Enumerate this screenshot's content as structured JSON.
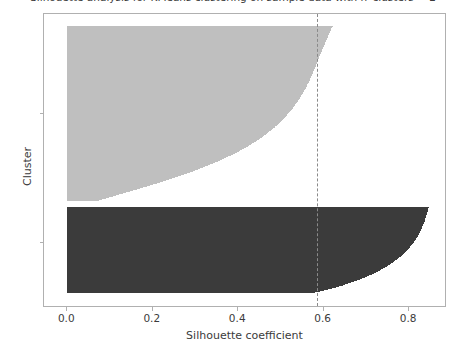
{
  "chart_data": {
    "type": "bar",
    "orientation": "horizontal",
    "title": "Silhouette analysis for KMeans clustering on sample data with n_clusters = 2",
    "xlabel": "Silhouette coefficient",
    "ylabel": "Cluster",
    "xlim": [
      -0.0545,
      0.8885
    ],
    "ylim": [
      0,
      1
    ],
    "grid": false,
    "legend": false,
    "xticks": [
      0.0,
      0.2,
      0.4,
      0.6,
      0.8
    ],
    "xticklabels": [
      "0.0",
      "0.2",
      "0.4",
      "0.6",
      "0.8"
    ],
    "yticks": [
      1,
      2
    ],
    "yticklabels": [
      "1",
      "2"
    ],
    "ytick_positions_px": [
      242,
      113
    ],
    "average_silhouette_score": 0.585,
    "average_line_label": "average silhouette score",
    "average_line_color": "#8a8a8a",
    "average_line_style": "dashed",
    "clusters": [
      {
        "label": "1",
        "name": "cluster-1",
        "color": "#3b3b3b",
        "n_samples": 86,
        "y_top_px": 206,
        "y_bottom_px": 292,
        "silhouette_min": 0.58,
        "silhouette_max": 0.846,
        "silhouette_values_ascending": [
          0.58,
          0.592,
          0.601,
          0.611,
          0.62,
          0.628,
          0.636,
          0.644,
          0.651,
          0.658,
          0.665,
          0.672,
          0.678,
          0.684,
          0.69,
          0.696,
          0.701,
          0.707,
          0.712,
          0.717,
          0.722,
          0.726,
          0.731,
          0.735,
          0.739,
          0.743,
          0.747,
          0.751,
          0.755,
          0.758,
          0.762,
          0.765,
          0.768,
          0.771,
          0.774,
          0.777,
          0.78,
          0.783,
          0.785,
          0.788,
          0.79,
          0.793,
          0.795,
          0.797,
          0.799,
          0.801,
          0.803,
          0.805,
          0.807,
          0.809,
          0.811,
          0.812,
          0.814,
          0.815,
          0.817,
          0.818,
          0.82,
          0.821,
          0.822,
          0.824,
          0.825,
          0.826,
          0.827,
          0.828,
          0.829,
          0.83,
          0.831,
          0.832,
          0.833,
          0.834,
          0.835,
          0.836,
          0.836,
          0.837,
          0.838,
          0.839,
          0.839,
          0.84,
          0.841,
          0.841,
          0.842,
          0.843,
          0.843,
          0.844,
          0.845,
          0.846
        ]
      },
      {
        "label": "2",
        "name": "cluster-2",
        "color": "#bfbfbf",
        "n_samples": 175,
        "y_top_px": 25,
        "y_bottom_px": 200,
        "silhouette_min": 0.075,
        "silhouette_max": 0.622,
        "silhouette_values_ascending": [
          0.075,
          0.082,
          0.09,
          0.098,
          0.106,
          0.114,
          0.122,
          0.13,
          0.138,
          0.146,
          0.154,
          0.162,
          0.17,
          0.178,
          0.186,
          0.194,
          0.201,
          0.209,
          0.216,
          0.224,
          0.231,
          0.238,
          0.245,
          0.252,
          0.259,
          0.266,
          0.273,
          0.28,
          0.286,
          0.293,
          0.299,
          0.305,
          0.311,
          0.317,
          0.323,
          0.329,
          0.335,
          0.341,
          0.346,
          0.352,
          0.357,
          0.362,
          0.367,
          0.372,
          0.377,
          0.382,
          0.387,
          0.392,
          0.396,
          0.401,
          0.405,
          0.409,
          0.414,
          0.418,
          0.422,
          0.426,
          0.43,
          0.433,
          0.437,
          0.441,
          0.444,
          0.448,
          0.451,
          0.455,
          0.458,
          0.461,
          0.464,
          0.467,
          0.47,
          0.473,
          0.476,
          0.479,
          0.482,
          0.485,
          0.487,
          0.49,
          0.492,
          0.495,
          0.497,
          0.5,
          0.502,
          0.504,
          0.507,
          0.509,
          0.511,
          0.513,
          0.515,
          0.517,
          0.519,
          0.521,
          0.523,
          0.525,
          0.527,
          0.529,
          0.531,
          0.532,
          0.534,
          0.536,
          0.537,
          0.539,
          0.541,
          0.542,
          0.544,
          0.545,
          0.547,
          0.548,
          0.55,
          0.551,
          0.552,
          0.554,
          0.555,
          0.556,
          0.558,
          0.559,
          0.56,
          0.561,
          0.562,
          0.564,
          0.565,
          0.566,
          0.567,
          0.568,
          0.569,
          0.57,
          0.571,
          0.572,
          0.573,
          0.574,
          0.575,
          0.576,
          0.577,
          0.578,
          0.579,
          0.58,
          0.581,
          0.582,
          0.583,
          0.584,
          0.585,
          0.585,
          0.586,
          0.587,
          0.588,
          0.589,
          0.59,
          0.591,
          0.592,
          0.593,
          0.594,
          0.595,
          0.596,
          0.597,
          0.598,
          0.599,
          0.6,
          0.601,
          0.602,
          0.603,
          0.604,
          0.605,
          0.606,
          0.607,
          0.608,
          0.609,
          0.61,
          0.611,
          0.612,
          0.613,
          0.614,
          0.615,
          0.616,
          0.617,
          0.618,
          0.619,
          0.622
        ]
      }
    ]
  }
}
